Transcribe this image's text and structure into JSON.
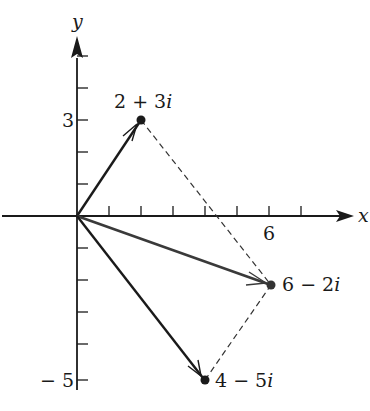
{
  "figure": {
    "type": "complex-plane vector addition",
    "axes": {
      "x_label": "x",
      "y_label": "y",
      "x_tick_label": "6",
      "y_tick_labels": [
        "3",
        "− 5"
      ],
      "x_ticks": [
        1,
        2,
        3,
        4,
        5,
        6,
        7
      ],
      "y_ticks": [
        -5,
        -4,
        -3,
        -2,
        -1,
        1,
        2,
        3,
        4,
        5
      ]
    },
    "points": [
      {
        "label": "2 + 3i",
        "x": 2,
        "y": 3
      },
      {
        "label": "6 − 2i",
        "x": 6,
        "y": -2
      },
      {
        "label": "4 − 5i",
        "x": 4,
        "y": -5
      }
    ],
    "vectors": [
      {
        "from": [
          0,
          0
        ],
        "to": [
          2,
          3
        ],
        "style": "solid-arrow"
      },
      {
        "from": [
          0,
          0
        ],
        "to": [
          6,
          -2
        ],
        "style": "solid-arrow"
      },
      {
        "from": [
          0,
          0
        ],
        "to": [
          4,
          -5
        ],
        "style": "solid-arrow"
      }
    ],
    "dashed_segments": [
      {
        "from": [
          2,
          3
        ],
        "to": [
          6,
          -2
        ]
      },
      {
        "from": [
          4,
          -5
        ],
        "to": [
          6,
          -2
        ]
      }
    ],
    "colors": {
      "ink": "#1a1a1a",
      "resultant": "#3a3a3a",
      "background": "#ffffff"
    }
  },
  "labels": {
    "x_axis": "x",
    "y_axis": "y",
    "tick_x6": "6",
    "tick_y3": "3",
    "tick_ym5": "− 5",
    "p1_main": "2 + 3",
    "p1_i": "i",
    "p2_main": "6 − 2",
    "p2_i": "i",
    "p3_main": "4 − 5",
    "p3_i": "i"
  }
}
